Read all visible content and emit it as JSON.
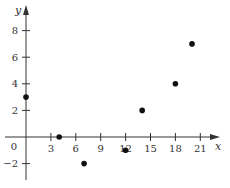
{
  "chart_data": {
    "type": "scatter",
    "title": "",
    "xlabel": "x",
    "ylabel": "y",
    "xlim": [
      -3,
      24
    ],
    "ylim": [
      -3.5,
      9.5
    ],
    "x_ticks": [
      3,
      6,
      9,
      12,
      15,
      18,
      21
    ],
    "y_ticks": [
      -2,
      2,
      4,
      6,
      8
    ],
    "origin_label": "0",
    "grid": false,
    "legend": null,
    "points": [
      {
        "x": 0,
        "y": 3
      },
      {
        "x": 4,
        "y": 0
      },
      {
        "x": 7,
        "y": -2
      },
      {
        "x": 12,
        "y": -1
      },
      {
        "x": 14,
        "y": 2
      },
      {
        "x": 18,
        "y": 4
      },
      {
        "x": 20,
        "y": 7
      }
    ],
    "colors": {
      "axis": "#333333",
      "point": "#111111"
    }
  }
}
